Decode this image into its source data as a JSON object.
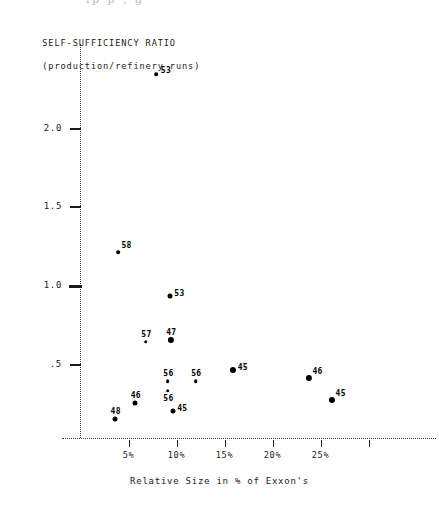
{
  "figure": {
    "top_cut_text": "ip                    p ,      g",
    "y_axis_title_line1": "SELF-SUFFICIENCY RATIO",
    "y_axis_title_line2": "(production/refinery runs)",
    "x_axis_title": "Relative Size in % of Exxon's"
  },
  "chart_data": {
    "type": "scatter",
    "title": "SELF-SUFFICIENCY RATIO (production/refinery runs)",
    "xlabel": "Relative Size in % of Exxon's",
    "ylabel": "SELF-SUFFICIENCY RATIO (production/refinery runs)",
    "xlim": [
      0,
      36
    ],
    "ylim": [
      0,
      2.45
    ],
    "grid": false,
    "legend": "none",
    "x_ticks": [
      {
        "value": 5,
        "label": "5%"
      },
      {
        "value": 10,
        "label": "10%"
      },
      {
        "value": 15,
        "label": "15%"
      },
      {
        "value": 20,
        "label": "20%"
      },
      {
        "value": 25,
        "label": "25%"
      },
      {
        "value": 30,
        "label": ""
      }
    ],
    "y_ticks": [
      {
        "value": 2.0,
        "label": "2.0"
      },
      {
        "value": 1.5,
        "label": "1.5"
      },
      {
        "value": 1.0,
        "label": "1.0"
      },
      {
        "value": 0.5,
        "label": ".5"
      }
    ],
    "points": [
      {
        "label": "53",
        "x": 7.9,
        "y": 2.34,
        "size": "small",
        "label_pos": "right"
      },
      {
        "label": "58",
        "x": 3.9,
        "y": 1.21,
        "size": "small",
        "label_pos": "above-right"
      },
      {
        "label": "53",
        "x": 9.3,
        "y": 0.93,
        "size": "medium",
        "label_pos": "right"
      },
      {
        "label": "57",
        "x": 6.8,
        "y": 0.64,
        "size": "small",
        "label_pos": "above"
      },
      {
        "label": "47",
        "x": 9.4,
        "y": 0.65,
        "size": "large",
        "label_pos": "above"
      },
      {
        "label": "56",
        "x": 9.1,
        "y": 0.39,
        "size": "small",
        "label_pos": "above"
      },
      {
        "label": "56",
        "x": 12.0,
        "y": 0.39,
        "size": "small",
        "label_pos": "above"
      },
      {
        "label": "56",
        "x": 9.1,
        "y": 0.33,
        "size": "small",
        "label_pos": "below"
      },
      {
        "label": "45",
        "x": 15.9,
        "y": 0.46,
        "size": "large",
        "label_pos": "right"
      },
      {
        "label": "46",
        "x": 23.8,
        "y": 0.41,
        "size": "large",
        "label_pos": "above-right"
      },
      {
        "label": "48",
        "x": 37.8,
        "y": 0.41,
        "size": "large",
        "label_pos": "above-right"
      },
      {
        "label": "45",
        "x": 26.2,
        "y": 0.27,
        "size": "large",
        "label_pos": "above-right"
      },
      {
        "label": "46",
        "x": 5.7,
        "y": 0.25,
        "size": "medium",
        "label_pos": "above"
      },
      {
        "label": "45",
        "x": 9.6,
        "y": 0.2,
        "size": "medium",
        "label_pos": "right"
      },
      {
        "label": "48",
        "x": 3.6,
        "y": 0.15,
        "size": "medium",
        "label_pos": "above"
      }
    ]
  }
}
